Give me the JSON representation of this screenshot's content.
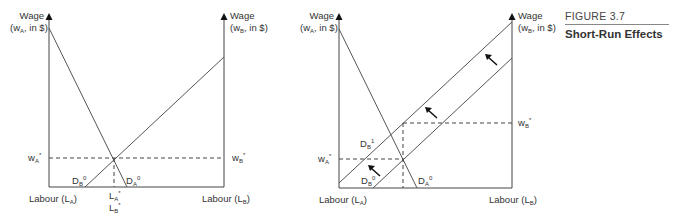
{
  "figure": {
    "number": "FIGURE 3.7",
    "title": "Short-Run Effects"
  },
  "left_diagram": {
    "left_axis": {
      "label_line1": "Wage",
      "label_line2_pre": "(w",
      "label_line2_sub": "A",
      "label_line2_post": ", in $)"
    },
    "right_axis": {
      "label_line1": "Wage",
      "label_line2_pre": "(w",
      "label_line2_sub": "B",
      "label_line2_post": ", in $)"
    },
    "x_left_label": {
      "pre": "Labour (L",
      "sub": "A",
      "post": ")"
    },
    "x_right_label": {
      "pre": "Labour (L",
      "sub": "B",
      "post": ")"
    },
    "wA_star": {
      "base": "w",
      "sub": "A",
      "sup": "*"
    },
    "wB_star": {
      "base": "w",
      "sub": "B",
      "sup": "*"
    },
    "LA_star": {
      "base": "L",
      "sub": "A",
      "sup": "*"
    },
    "LB_star": {
      "base": "L",
      "sub": "B",
      "sup": "*"
    },
    "DB0": {
      "base": "D",
      "sub": "B",
      "sup": "0"
    },
    "DA0": {
      "base": "D",
      "sub": "A",
      "sup": "0"
    }
  },
  "right_diagram": {
    "left_axis": {
      "label_line1": "Wage",
      "label_line2_pre": "(w",
      "label_line2_sub": "A",
      "label_line2_post": ", in $)"
    },
    "right_axis": {
      "label_line1": "Wage",
      "label_line2_pre": "(w",
      "label_line2_sub": "B",
      "label_line2_post": ", in $)"
    },
    "x_left_label": {
      "pre": "Labour (L",
      "sub": "A",
      "post": ")"
    },
    "x_right_label": {
      "pre": "Labour (L",
      "sub": "B",
      "post": ")"
    },
    "wA_star": {
      "base": "w",
      "sub": "A",
      "sup": "*"
    },
    "wB_star": {
      "base": "w",
      "sub": "B",
      "sup": "*"
    },
    "DB1": {
      "base": "D",
      "sub": "B",
      "sup": "1"
    },
    "DB0": {
      "base": "D",
      "sub": "B",
      "sup": "0"
    },
    "DA0": {
      "base": "D",
      "sub": "A",
      "sup": "0"
    },
    "shift_arrows": 3
  },
  "colors": {
    "line": "#555555",
    "axis": "#444444",
    "arrow": "#111111",
    "text": "#333333"
  }
}
